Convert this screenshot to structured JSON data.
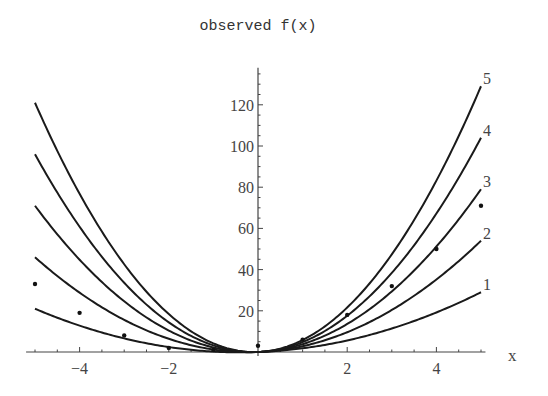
{
  "chart_data": {
    "type": "line",
    "title": "observed f(x)",
    "xlabel": "x",
    "ylabel": "",
    "xlim": [
      -5.2,
      5.1
    ],
    "ylim": [
      0,
      138
    ],
    "x_ticks": [
      -4,
      -2,
      2,
      4
    ],
    "x_tick_labels": [
      "-4",
      "-2",
      "2",
      "4"
    ],
    "y_ticks": [
      20,
      40,
      60,
      80,
      100,
      120
    ],
    "y_tick_labels": [
      "20",
      "40",
      "60",
      "80",
      "100",
      "120"
    ],
    "grid": false,
    "legend": "none (curves labeled at right end)",
    "series": [
      {
        "name": "1",
        "kind": "curve",
        "formula": "1*x^2 + 0.8*x",
        "x_range": [
          -5,
          5
        ]
      },
      {
        "name": "2",
        "kind": "curve",
        "formula": "2*x^2 + 0.8*x",
        "x_range": [
          -5,
          5
        ]
      },
      {
        "name": "3",
        "kind": "curve",
        "formula": "3*x^2 + 0.8*x",
        "x_range": [
          -5,
          5
        ]
      },
      {
        "name": "4",
        "kind": "curve",
        "formula": "4*x^2 + 0.8*x",
        "x_range": [
          -5,
          5
        ]
      },
      {
        "name": "5",
        "kind": "curve",
        "formula": "5*x^2 + 0.8*x",
        "x_range": [
          -5,
          5
        ]
      },
      {
        "name": "observed",
        "kind": "points",
        "x": [
          -5,
          -4,
          -3,
          -2,
          -1,
          0,
          1,
          2,
          3,
          4,
          5
        ],
        "y": [
          33,
          19,
          8,
          2,
          1,
          3,
          6,
          18,
          32,
          50,
          71
        ]
      }
    ]
  },
  "plot": {
    "title": "observed f(x)",
    "x_axis_label": "x",
    "curve_labels": [
      "1",
      "2",
      "3",
      "4",
      "5"
    ]
  }
}
